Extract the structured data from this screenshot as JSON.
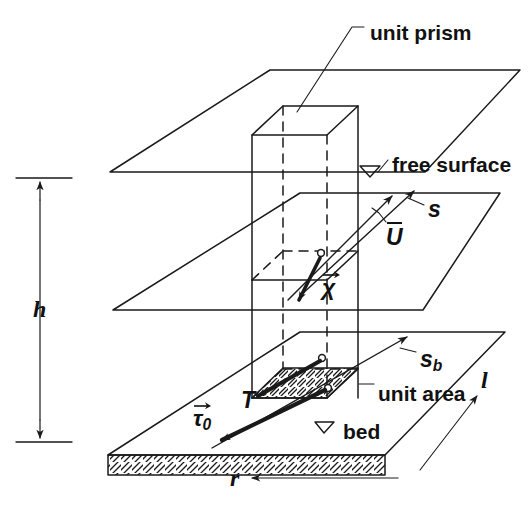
{
  "figure": {
    "width": 529,
    "height": 526,
    "line_color": "#1a1a1a",
    "background": "#ffffff"
  },
  "labels": {
    "unit_prism": "unit prism",
    "free_surface": "free surface",
    "bed": "bed",
    "unit_area": "unit area",
    "depth": "h",
    "r_axis": "r",
    "l_axis": "l",
    "mean_velocity": "U",
    "surface_slope_vector": "s",
    "bed_slope_vector": "s",
    "bed_slope_subscript": "b",
    "chi_vector": "χ",
    "depth_integrated_stress": "T",
    "bed_shear_stress": "τ",
    "bed_shear_subscript": "0",
    "water_level_symbol": "▽"
  },
  "annotations": [
    {
      "name": "unit-prism",
      "text": "unit prism",
      "style": "plain",
      "x": 370,
      "y": 22
    },
    {
      "name": "free-surface",
      "text": "free surface",
      "style": "plain",
      "x": 392,
      "y": 154
    },
    {
      "name": "bed",
      "text": "bed",
      "style": "plain",
      "x": 343,
      "y": 421
    },
    {
      "name": "unit-area",
      "text": "unit area",
      "style": "plain",
      "x": 378,
      "y": 383
    }
  ],
  "symbols": [
    {
      "name": "depth-h",
      "text": "h",
      "style": "italic",
      "x": 33,
      "y": 297
    },
    {
      "name": "r-axis",
      "text": "r",
      "style": "italic",
      "x": 230,
      "y": 481
    },
    {
      "name": "l-axis",
      "text": "l",
      "style": "italic",
      "x": 481,
      "y": 381
    },
    {
      "name": "mean-velocity-U",
      "text": "U",
      "style": "bold-italic-overbar",
      "x": 388,
      "y": 226
    },
    {
      "name": "surface-slope-s",
      "text": "s",
      "style": "bold-italic",
      "x": 428,
      "y": 203
    },
    {
      "name": "bed-slope-sb",
      "text": "s",
      "subscript": "b",
      "style": "bold-italic",
      "x": 420,
      "y": 353
    },
    {
      "name": "chi-vector",
      "text": "χ",
      "style": "bold-italic-vector",
      "x": 322,
      "y": 281
    },
    {
      "name": "stress-T",
      "text": "T",
      "style": "bold-italic",
      "x": 241,
      "y": 394
    },
    {
      "name": "tau-zero",
      "text": "τ",
      "subscript": "0",
      "style": "bold-italic-vector",
      "x": 196,
      "y": 412
    }
  ],
  "planes": [
    {
      "name": "free-surface-plane",
      "corners": [
        [
          270,
          70
        ],
        [
          520,
          70
        ],
        [
          425,
          172
        ],
        [
          110,
          172
        ]
      ]
    },
    {
      "name": "mid-plane",
      "corners": [
        [
          300,
          193
        ],
        [
          500,
          193
        ],
        [
          423,
          310
        ],
        [
          113,
          310
        ]
      ]
    },
    {
      "name": "bed-plane",
      "corners": [
        [
          300,
          332
        ],
        [
          505,
          332
        ],
        [
          385,
          455
        ],
        [
          108,
          455
        ]
      ]
    }
  ],
  "prism": {
    "name": "unit-prism",
    "top_face": [
      [
        283,
        106
      ],
      [
        358,
        106
      ],
      [
        327,
        135
      ],
      [
        252,
        135
      ]
    ],
    "vertical_edges_x": [
      252,
      282,
      328,
      358
    ],
    "top_y": 106,
    "bottom_y": 398
  },
  "unit_area": {
    "name": "unit-area-patch",
    "corners": [
      [
        283,
        368
      ],
      [
        358,
        368
      ],
      [
        327,
        398
      ],
      [
        252,
        398
      ]
    ],
    "hatched": true
  },
  "dimension": {
    "name": "depth-dimension",
    "x": 40,
    "top_y": 178,
    "bottom_y": 442,
    "double_headed": true
  },
  "vectors": [
    {
      "name": "mean-velocity-arrow",
      "from": [
        300,
        290
      ],
      "to": [
        400,
        195
      ]
    },
    {
      "name": "surface-slope-arrow",
      "from": [
        310,
        292
      ],
      "to": [
        416,
        190
      ]
    },
    {
      "name": "chi-arrow",
      "from": [
        320,
        255
      ],
      "to": [
        296,
        300
      ]
    },
    {
      "name": "stress-T-arrow",
      "from": [
        320,
        362
      ],
      "to": [
        255,
        398
      ]
    },
    {
      "name": "tau-zero-arrow",
      "from": [
        325,
        390
      ],
      "to": [
        218,
        440
      ]
    },
    {
      "name": "bed-slope-arrow",
      "from": [
        330,
        392
      ],
      "to": [
        410,
        338
      ]
    },
    {
      "name": "l-arrow",
      "from": [
        440,
        440
      ],
      "to": [
        478,
        395
      ]
    },
    {
      "name": "r-arrow",
      "from": [
        390,
        478
      ],
      "to": [
        248,
        478
      ]
    }
  ]
}
